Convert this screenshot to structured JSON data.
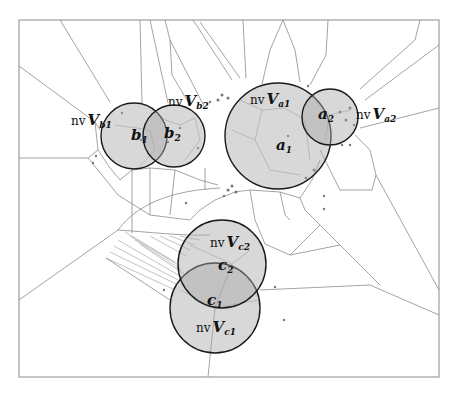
{
  "diagram": {
    "colors": {
      "circle_fill": "#a8a8a8",
      "circle_stroke": "#1a1a1a",
      "edge": "#8c8c8c",
      "background": "#ffffff"
    },
    "circles": [
      {
        "id": "b1",
        "point_label": "b",
        "point_sub": "1",
        "region_prefix": "nv",
        "region_V": "V",
        "region_sub": "b1"
      },
      {
        "id": "b2",
        "point_label": "b",
        "point_sub": "2",
        "region_prefix": "nv",
        "region_V": "V",
        "region_sub": "b2"
      },
      {
        "id": "a1",
        "point_label": "a",
        "point_sub": "1",
        "region_prefix": "nv",
        "region_V": "V",
        "region_sub": "a1"
      },
      {
        "id": "a2",
        "point_label": "a",
        "point_sub": "2",
        "region_prefix": "nv",
        "region_V": "V",
        "region_sub": "a2"
      },
      {
        "id": "c2",
        "point_label": "c",
        "point_sub": "2",
        "region_prefix": "nv",
        "region_V": "V",
        "region_sub": "c2"
      },
      {
        "id": "c1",
        "point_label": "c",
        "point_sub": "1",
        "region_prefix": "nv",
        "region_V": "V",
        "region_sub": "c1"
      }
    ]
  }
}
